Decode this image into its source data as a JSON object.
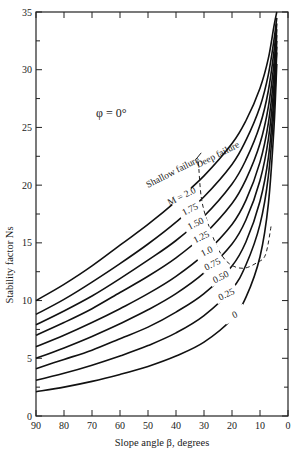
{
  "chart_data": {
    "type": "line",
    "title": "",
    "annotation_phi": "φ = 0°",
    "xlabel": "Slope angle β, degrees",
    "ylabel": "Stability factor Ns",
    "xlim": [
      90,
      0
    ],
    "ylim": [
      0,
      35
    ],
    "xticks": [
      90,
      80,
      70,
      60,
      50,
      40,
      30,
      20,
      10,
      0
    ],
    "yticks": [
      0,
      5,
      10,
      15,
      20,
      25,
      30,
      35
    ],
    "grid": false,
    "x": [
      90,
      80,
      70,
      60,
      50,
      40,
      30,
      20,
      15,
      10,
      7,
      5,
      4
    ],
    "series": [
      {
        "name": "M = 2.0",
        "values": [
          10.0,
          11.4,
          13.0,
          14.8,
          16.6,
          18.6,
          20.8,
          23.6,
          25.6,
          28.4,
          31.0,
          33.8,
          35.0
        ]
      },
      {
        "name": "1.75",
        "values": [
          8.8,
          10.1,
          11.6,
          13.2,
          14.9,
          16.8,
          19.0,
          21.8,
          23.9,
          26.8,
          29.6,
          32.6,
          34.5
        ]
      },
      {
        "name": "1.50",
        "values": [
          7.9,
          9.1,
          10.4,
          11.9,
          13.5,
          15.2,
          17.3,
          20.1,
          22.2,
          25.2,
          28.2,
          31.6,
          34.0
        ]
      },
      {
        "name": "1.25",
        "values": [
          7.0,
          8.1,
          9.3,
          10.7,
          12.1,
          13.7,
          15.7,
          18.4,
          20.5,
          23.6,
          26.8,
          30.6,
          33.5
        ]
      },
      {
        "name": "1.0",
        "values": [
          6.0,
          7.0,
          8.1,
          9.3,
          10.6,
          12.1,
          14.0,
          16.6,
          18.7,
          22.0,
          25.4,
          29.6,
          33.0
        ]
      },
      {
        "name": "0.75",
        "values": [
          5.0,
          5.9,
          6.9,
          8.0,
          9.2,
          10.6,
          12.4,
          14.9,
          17.0,
          20.4,
          24.0,
          28.6,
          32.5
        ]
      },
      {
        "name": "0.50",
        "values": [
          4.1,
          4.9,
          5.7,
          6.7,
          7.7,
          9.0,
          10.6,
          13.0,
          15.1,
          18.6,
          22.4,
          27.6,
          32.0
        ]
      },
      {
        "name": "0.25",
        "values": [
          3.1,
          3.7,
          4.4,
          5.2,
          6.1,
          7.2,
          8.7,
          11.0,
          13.1,
          16.6,
          20.8,
          26.6,
          31.5
        ]
      },
      {
        "name": "0",
        "values": [
          2.1,
          2.5,
          3.0,
          3.6,
          4.3,
          5.2,
          6.4,
          8.4,
          10.3,
          13.8,
          18.4,
          25.0,
          30.5
        ]
      }
    ],
    "boundary_line": {
      "name": "Shallow/Deep failure boundary (dashed)",
      "points": [
        [
          32,
          22.0
        ],
        [
          31,
          19.0
        ],
        [
          29,
          17.0
        ],
        [
          25,
          14.5
        ],
        [
          21,
          13.2
        ],
        [
          16,
          12.8
        ],
        [
          11,
          13.3
        ],
        [
          8,
          14.0
        ],
        [
          6,
          16.5
        ]
      ]
    },
    "annotations": [
      "Shallow failure",
      "Deep failure",
      "φ = 0°"
    ]
  }
}
